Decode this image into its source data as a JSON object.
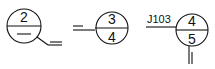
{
  "diagram": {
    "type": "detail-reference-symbols",
    "symbols": [
      {
        "id": "symbol-1",
        "top": "2",
        "bottom": "—",
        "leader": "angled-with-double-line"
      },
      {
        "id": "symbol-2",
        "top": "3",
        "bottom": "4",
        "leader": "horizontal-double-line"
      },
      {
        "id": "symbol-3",
        "top": "4",
        "bottom": "5",
        "label": "J103",
        "leader": "vertical-double-line"
      }
    ]
  }
}
